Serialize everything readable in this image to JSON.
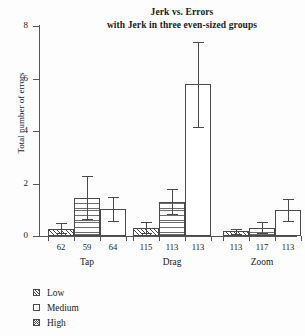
{
  "chart_data": {
    "type": "bar",
    "title": "Jerk vs. Errors",
    "subtitle": "with Jerk in three even-sized groups",
    "xlabel": "",
    "ylabel": "Total number of errors",
    "ylim": [
      0,
      8
    ],
    "yticks": [
      0,
      2,
      4,
      6,
      8
    ],
    "grid": false,
    "legend_position": "below-left",
    "categories": [
      "Tap",
      "Drag",
      "Zoom"
    ],
    "series": [
      {
        "name": "Low",
        "pattern": "diagonal-hatch",
        "values": [
          0.28,
          0.32,
          0.18
        ],
        "err_low": [
          0.1,
          0.12,
          0.08
        ],
        "err_high": [
          0.5,
          0.55,
          0.28
        ],
        "n": [
          62,
          115,
          113
        ]
      },
      {
        "name": "Medium",
        "pattern": "horizontal-lines",
        "values": [
          1.45,
          1.3,
          0.3
        ],
        "err_low": [
          0.65,
          0.82,
          0.12
        ],
        "err_high": [
          2.28,
          1.8,
          0.55
        ],
        "n": [
          59,
          113,
          117
        ]
      },
      {
        "name": "High",
        "pattern": "plain-white",
        "values": [
          1.03,
          5.8,
          1.0
        ],
        "err_low": [
          0.57,
          4.17,
          0.57
        ],
        "err_high": [
          1.5,
          7.38,
          1.42
        ],
        "n": [
          64,
          113,
          113
        ]
      }
    ],
    "group_n_labels": [
      [
        "62",
        "59",
        "64"
      ],
      [
        "115",
        "113",
        "113"
      ],
      [
        "113",
        "117",
        "113"
      ]
    ]
  },
  "legend": {
    "items": [
      {
        "label": "Low"
      },
      {
        "label": "Medium"
      },
      {
        "label": "High"
      }
    ]
  },
  "colors": {
    "background": "#fdfdfd",
    "ink": "#1a1a1a",
    "axis": "#555555",
    "bar_outline": "#4a4a4a",
    "bar_fill": "#ffffff"
  },
  "ytick_labels": [
    "0",
    "2",
    "4",
    "6",
    "8"
  ]
}
